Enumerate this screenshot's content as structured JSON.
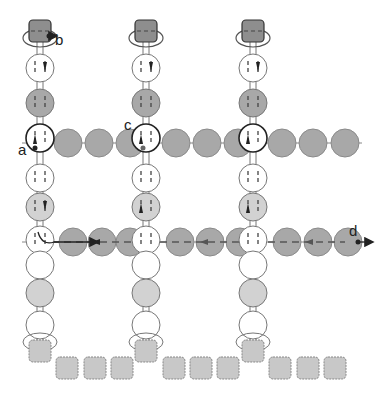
{
  "diagram": {
    "labels": {
      "a": "a",
      "b": "b",
      "c": "c",
      "d": "d"
    },
    "colors": {
      "dark_bead": "#a8a8a8",
      "light_bead": "#d2d2d2",
      "white_bead": "#ffffff",
      "outline": "#555555",
      "dark_square": "#8e8e8e",
      "light_square": "#c8c8c8",
      "path": "#222222",
      "dashed": "#555555"
    },
    "columns": [
      {
        "x": 40,
        "top_square_y": 30,
        "beads": [
          {
            "y": 68,
            "fill": "white",
            "arrow": "down"
          },
          {
            "y": 103,
            "fill": "dark"
          },
          {
            "y": 138,
            "fill": "white",
            "arrow": "up",
            "outline": "bold"
          },
          {
            "y": 178,
            "fill": "white"
          },
          {
            "y": 207,
            "fill": "light",
            "arrow": "down"
          },
          {
            "y": 240,
            "fill": "white"
          },
          {
            "y": 265,
            "fill": "white"
          },
          {
            "y": 293,
            "fill": "light"
          },
          {
            "y": 325,
            "fill": "white"
          }
        ],
        "bottom_square_y": 350
      },
      {
        "x": 146,
        "top_square_y": 30,
        "beads": [
          {
            "y": 68,
            "fill": "white",
            "arrow": "down"
          },
          {
            "y": 103,
            "fill": "dark"
          },
          {
            "y": 138,
            "fill": "white",
            "arrow": "up",
            "outline": "bold"
          },
          {
            "y": 178,
            "fill": "white"
          },
          {
            "y": 207,
            "fill": "light",
            "arrow": "up"
          },
          {
            "y": 240,
            "fill": "white"
          },
          {
            "y": 265,
            "fill": "white"
          },
          {
            "y": 293,
            "fill": "light"
          },
          {
            "y": 325,
            "fill": "white"
          }
        ],
        "bottom_square_y": 350
      },
      {
        "x": 253,
        "top_square_y": 30,
        "beads": [
          {
            "y": 68,
            "fill": "white",
            "arrow": "down"
          },
          {
            "y": 103,
            "fill": "dark"
          },
          {
            "y": 138,
            "fill": "white",
            "arrow": "up",
            "outline": "bold"
          },
          {
            "y": 178,
            "fill": "white"
          },
          {
            "y": 207,
            "fill": "light",
            "arrow": "up"
          },
          {
            "y": 240,
            "fill": "white"
          },
          {
            "y": 265,
            "fill": "white"
          },
          {
            "y": 293,
            "fill": "light"
          },
          {
            "y": 325,
            "fill": "white"
          }
        ],
        "bottom_square_y": 350
      }
    ],
    "rows": [
      {
        "y": 143,
        "beads_x": [
          68,
          99,
          130,
          176,
          207,
          238,
          282,
          313,
          345
        ],
        "fill": "dark",
        "dashed": false
      },
      {
        "y": 242,
        "beads_x": [
          73,
          102,
          130,
          180,
          210,
          240,
          287,
          318,
          348
        ],
        "fill": "dark",
        "dashed": true
      }
    ],
    "bottom_squares_x": [
      67,
      95,
      122,
      174,
      201,
      228,
      280,
      308,
      335
    ],
    "bottom_squares_y": 368
  }
}
